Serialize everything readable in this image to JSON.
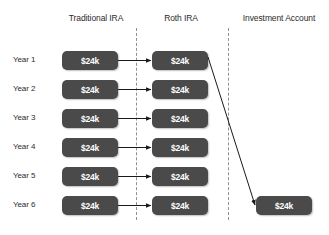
{
  "diagram": {
    "columns": [
      {
        "id": "traditional-ira",
        "label": "Traditional IRA"
      },
      {
        "id": "roth-ira",
        "label": "Roth IRA"
      },
      {
        "id": "investment-account",
        "label": "Investment Account"
      }
    ],
    "rows": [
      {
        "id": "year-1",
        "label": "Year 1"
      },
      {
        "id": "year-2",
        "label": "Year 2"
      },
      {
        "id": "year-3",
        "label": "Year 3"
      },
      {
        "id": "year-4",
        "label": "Year 4"
      },
      {
        "id": "year-5",
        "label": "Year 5"
      },
      {
        "id": "year-6",
        "label": "Year 6"
      }
    ],
    "boxes": {
      "traditional": [
        "$24k",
        "$24k",
        "$24k",
        "$24k",
        "$24k",
        "$24k"
      ],
      "roth": [
        "$24k",
        "$24k",
        "$24k",
        "$24k",
        "$24k",
        "$24k"
      ],
      "investment": [
        "$24k"
      ]
    },
    "colors": {
      "box_fill": "#4a4a4a",
      "box_text": "#ffffff",
      "label_text": "#2b2b2b",
      "divider": "#8f8f8f",
      "arrow": "#1a1a1a",
      "background": "#ffffff"
    },
    "arrows": {
      "conversion_label": "traditional-to-roth",
      "withdrawal_label": "roth-year1-to-investment-year6"
    }
  }
}
